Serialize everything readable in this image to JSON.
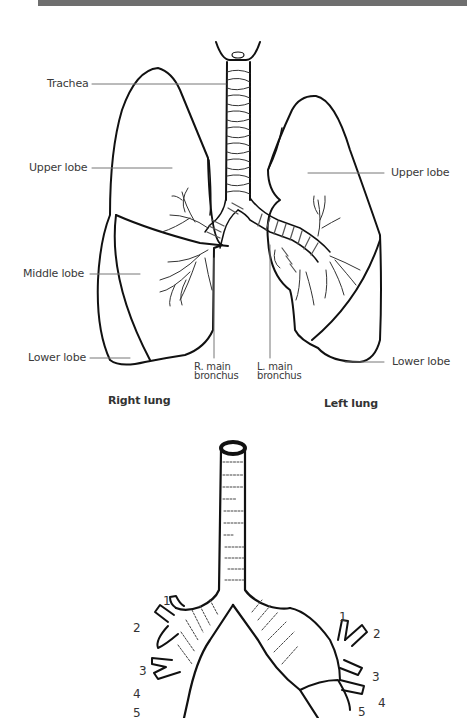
{
  "header": {
    "bar_color": "#6e6e6e"
  },
  "figure_top": {
    "title": "Lungs and bronchial tree",
    "labels": {
      "trachea": "Trachea",
      "right_upper_lobe": "Upper lobe",
      "right_middle_lobe": "Middle lobe",
      "right_lower_lobe": "Lower lobe",
      "left_upper_lobe": "Upper lobe",
      "left_lower_lobe": "Lower lobe",
      "r_main_bronchus_line1": "R. main",
      "r_main_bronchus_line2": "bronchus",
      "l_main_bronchus_line1": "L. main",
      "l_main_bronchus_line2": "bronchus",
      "right_lung": "Right lung",
      "left_lung": "Left lung"
    }
  },
  "figure_bottom": {
    "title": "Segmental bronchi",
    "right_numbers": [
      "1",
      "2",
      "3",
      "4",
      "5"
    ],
    "left_numbers": [
      "1",
      "2",
      "3",
      "4",
      "5"
    ]
  }
}
